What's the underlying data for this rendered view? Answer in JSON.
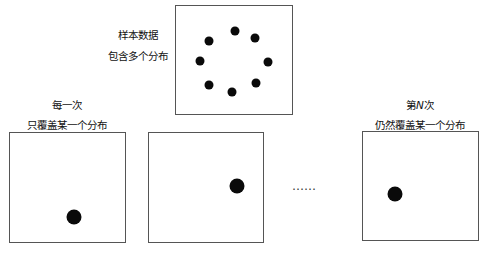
{
  "sample_panel": {
    "label_line1": "样本数据",
    "label_line2": "包含多个分布",
    "dots": [
      {
        "x": 235,
        "y": 31
      },
      {
        "x": 255,
        "y": 38
      },
      {
        "x": 268,
        "y": 62
      },
      {
        "x": 256,
        "y": 83
      },
      {
        "x": 232,
        "y": 92
      },
      {
        "x": 209,
        "y": 85
      },
      {
        "x": 200,
        "y": 61
      },
      {
        "x": 209,
        "y": 41
      }
    ]
  },
  "first_panel": {
    "label_line1": "每一次",
    "label_line2": "只覆盖某一个分布",
    "dot": {
      "x": 74,
      "y": 217
    }
  },
  "second_panel": {
    "dot": {
      "x": 237,
      "y": 186
    }
  },
  "ellipsis": "……",
  "nth_panel": {
    "label_line1_prefix": "第",
    "label_line1_var": "N",
    "label_line1_suffix": "次",
    "label_line2": "仍然覆盖某一个分布",
    "dot": {
      "x": 395,
      "y": 194
    }
  }
}
